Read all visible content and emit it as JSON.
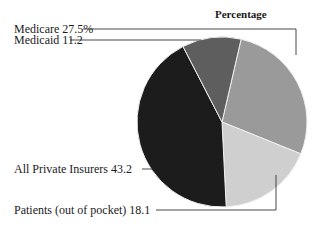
{
  "chart_data": {
    "type": "pie",
    "title": "Percentage",
    "slices": [
      {
        "label": "Medicare",
        "value": 27.5,
        "display": "Medicare  27.5%",
        "color": "#9a9a9a"
      },
      {
        "label": "Patients (out of pocket)",
        "value": 18.1,
        "display": "Patients (out of pocket) 18.1",
        "color": "#cfcfcf"
      },
      {
        "label": "All Private Insurers",
        "value": 43.2,
        "display": "All Private Insurers 43.2",
        "color": "#1c1c1c"
      },
      {
        "label": "Medicaid",
        "value": 11.2,
        "display": "Medicaid 11.2",
        "color": "#5e5e5e"
      }
    ],
    "start_angle_deg": 13,
    "direction": "clockwise",
    "legend": "leader-line labels on left"
  }
}
